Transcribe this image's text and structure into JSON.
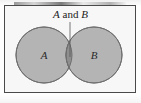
{
  "figure": {
    "type": "venn-diagram",
    "kind": "two-set-intersection",
    "background_color": "#f7f7f7",
    "frame_color": "#4a4a4a",
    "circle_fill": "#b4b4b4",
    "circle_stroke": "#6e6e6e",
    "intersection_fill": "#8e8e8e",
    "leader_line_color": "#555555"
  },
  "caption": {
    "full_text": "A and B",
    "set_left": "A",
    "conjunction": "and",
    "set_right": "B"
  },
  "sets": [
    {
      "id": "set-a",
      "label": "A",
      "center_x": 44,
      "center_y": 55,
      "radius": 28
    },
    {
      "id": "set-b",
      "label": "B",
      "center_x": 94,
      "center_y": 55,
      "radius": 28
    }
  ],
  "intersection": {
    "label": "A and B",
    "highlighted": true,
    "leader_line": {
      "from_x": 70,
      "from_y": 22,
      "to_x": 70,
      "to_y": 57
    }
  }
}
